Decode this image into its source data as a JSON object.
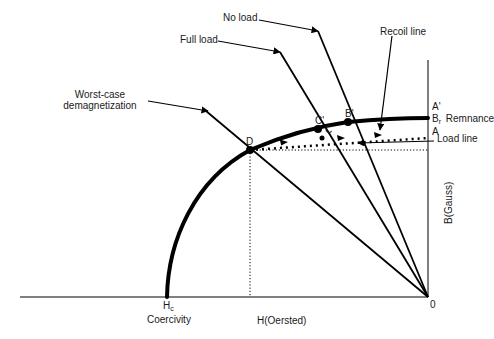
{
  "diagram": {
    "type": "magnet-BH-demagnetization-curve",
    "axes": {
      "x_label": "H(Oersted)",
      "y_label": "B(Gauss)",
      "origin_label": "0"
    },
    "points": {
      "coercivity": {
        "symbol": "H",
        "subscript": "c",
        "caption": "Coercivity"
      },
      "remanence": {
        "symbol": "B",
        "subscript": "r",
        "caption": "Remnance"
      },
      "A_prime": "A'",
      "A": "A",
      "B_prime": "B'",
      "C_prime": "C'",
      "C": "C",
      "D": "D"
    },
    "callouts": {
      "no_load": "No load",
      "full_load": "Full load",
      "recoil_line": "Recoil line",
      "worst_case": [
        "Worst-case",
        "demagnetization"
      ],
      "load_line": "Load line"
    },
    "colors": {
      "ink": "#000000",
      "text": "#1a1a1a",
      "background": "#ffffff"
    }
  }
}
